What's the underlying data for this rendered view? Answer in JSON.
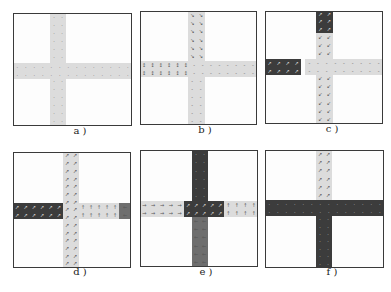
{
  "figure": {
    "colors": {
      "light": "#dcdcdc",
      "dark": "#3c3c3c",
      "mid": "#6e6e6e",
      "border": "#3a3a3a"
    },
    "panels": [
      {
        "label": "a )",
        "box": [
          13,
          13,
          119,
          113
        ],
        "label_pos": [
          52,
          131
        ],
        "segments": [
          {
            "name": "vertical-road",
            "x": 50,
            "y": 13,
            "w": 16,
            "h": 113,
            "shade": "light",
            "arrow": "·",
            "cols": 2
          },
          {
            "name": "horizontal-road",
            "x": 13,
            "y": 63,
            "w": 119,
            "h": 16,
            "shade": "light",
            "arrow": "·",
            "cols": 14
          }
        ]
      },
      {
        "label": "b )",
        "box": [
          140,
          11,
          117,
          114
        ],
        "label_pos": [
          177,
          130
        ],
        "segments": [
          {
            "name": "vertical-road-upper",
            "x": 50,
            "y": 11,
            "w": 17,
            "h": 50,
            "shade": "light",
            "arrow": "↘",
            "cols": 2
          },
          {
            "name": "vertical-road-lower",
            "x": 50,
            "y": 77,
            "w": 17,
            "h": 48,
            "shade": "light",
            "arrow": "-",
            "cols": 2
          },
          {
            "name": "horizontal-road-left",
            "x": 140,
            "y": 61,
            "w": 50,
            "h": 16,
            "shade": "light",
            "arrow": "↕",
            "cols": 6
          },
          {
            "name": "horizontal-road-right",
            "x": 190,
            "y": 61,
            "w": 67,
            "h": 16,
            "shade": "light",
            "arrow": "-",
            "cols": 8
          }
        ]
      },
      {
        "label": "c )",
        "box": [
          265,
          11,
          118,
          113
        ],
        "label_pos": [
          304,
          129
        ],
        "segments": [
          {
            "name": "vertical-road-upper-congested",
            "x": 316,
            "y": 11,
            "w": 17,
            "h": 22,
            "shade": "dark",
            "arrow": "↗",
            "cols": 2
          },
          {
            "name": "vertical-road-lower",
            "x": 316,
            "y": 33,
            "w": 17,
            "h": 91,
            "shade": "light",
            "arrow": "↙",
            "cols": 2
          },
          {
            "name": "horizontal-road-left-congested",
            "x": 265,
            "y": 59,
            "w": 36,
            "h": 16,
            "shade": "dark",
            "arrow": "↗",
            "cols": 4
          },
          {
            "name": "horizontal-road-right",
            "x": 305,
            "y": 59,
            "w": 78,
            "h": 16,
            "shade": "light",
            "arrow": "-",
            "cols": 9
          }
        ]
      },
      {
        "label": "d )",
        "box": [
          13,
          152,
          118,
          116
        ],
        "label_pos": [
          52,
          272
        ],
        "segments": [
          {
            "name": "vertical-road",
            "x": 63,
            "y": 152,
            "w": 16,
            "h": 116,
            "shade": "light",
            "arrow": "↗",
            "cols": 2
          },
          {
            "name": "horizontal-road-left-congested",
            "x": 13,
            "y": 203,
            "w": 50,
            "h": 16,
            "shade": "dark",
            "arrow": "↗",
            "cols": 6
          },
          {
            "name": "horizontal-road-right",
            "x": 79,
            "y": 203,
            "w": 40,
            "h": 16,
            "shade": "light",
            "arrow": "↑",
            "cols": 5
          },
          {
            "name": "horizontal-road-end",
            "x": 119,
            "y": 203,
            "w": 12,
            "h": 16,
            "shade": "mid",
            "arrow": "←",
            "cols": 1
          }
        ]
      },
      {
        "label": "e )",
        "box": [
          140,
          150,
          118,
          117
        ],
        "label_pos": [
          178,
          272
        ],
        "segments": [
          {
            "name": "vertical-road-upper-congested",
            "x": 192,
            "y": 150,
            "w": 16,
            "h": 51,
            "shade": "dark",
            "arrow": "·",
            "cols": 2
          },
          {
            "name": "intersection-congested",
            "x": 184,
            "y": 201,
            "w": 40,
            "h": 16,
            "shade": "dark",
            "arrow": "↗",
            "cols": 5
          },
          {
            "name": "vertical-road-lower",
            "x": 192,
            "y": 217,
            "w": 16,
            "h": 50,
            "shade": "mid",
            "arrow": "←",
            "cols": 2
          },
          {
            "name": "horizontal-road-left",
            "x": 140,
            "y": 201,
            "w": 44,
            "h": 16,
            "shade": "light",
            "arrow": "→",
            "cols": 5
          },
          {
            "name": "horizontal-road-right",
            "x": 224,
            "y": 201,
            "w": 34,
            "h": 16,
            "shade": "light",
            "arrow": "↑",
            "cols": 4
          }
        ]
      },
      {
        "label": "f )",
        "box": [
          265,
          150,
          119,
          118
        ],
        "label_pos": [
          304,
          272
        ],
        "segments": [
          {
            "name": "vertical-road-upper",
            "x": 316,
            "y": 150,
            "w": 16,
            "h": 50,
            "shade": "light",
            "arrow": "↗",
            "cols": 2
          },
          {
            "name": "horizontal-road-congested",
            "x": 265,
            "y": 200,
            "w": 119,
            "h": 16,
            "shade": "dark",
            "arrow": "·",
            "cols": 14
          },
          {
            "name": "vertical-road-lower-congested",
            "x": 316,
            "y": 216,
            "w": 16,
            "h": 52,
            "shade": "dark",
            "arrow": "·",
            "cols": 2
          }
        ]
      }
    ]
  }
}
